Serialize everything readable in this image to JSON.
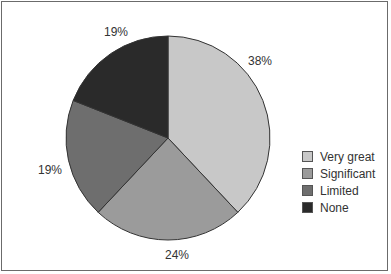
{
  "chart_data": {
    "type": "pie",
    "title": "",
    "categories": [
      "Very great",
      "Significant",
      "Limited",
      "None"
    ],
    "values": [
      38,
      24,
      19,
      19
    ],
    "labels": [
      "38%",
      "24%",
      "19%",
      "19%"
    ],
    "colors": [
      "#c8c8c8",
      "#9b9b9b",
      "#6e6e6e",
      "#2a2a2a"
    ],
    "start_angle": "top (12 o'clock)",
    "direction": "clockwise",
    "legend_position": "right"
  },
  "legend": {
    "items": [
      {
        "label": "Very great",
        "color": "#c8c8c8"
      },
      {
        "label": "Significant",
        "color": "#9b9b9b"
      },
      {
        "label": "Limited",
        "color": "#6e6e6e"
      },
      {
        "label": "None",
        "color": "#2a2a2a"
      }
    ]
  }
}
